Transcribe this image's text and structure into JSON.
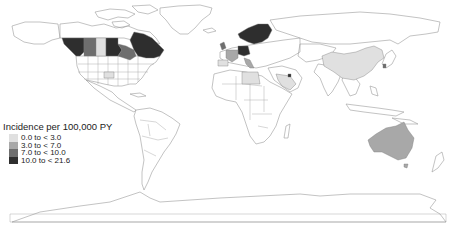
{
  "figure": {
    "type": "choropleth world map",
    "palette": {
      "c0": "#e0e0e0",
      "c1": "#a8a8a8",
      "c2": "#6e6e6e",
      "c3": "#2e2e2e",
      "no_data": "#ffffff",
      "border": "#9a9a9a"
    }
  },
  "legend": {
    "title": "Incidence per 100,000 PY",
    "items": [
      {
        "label": "0.0 to < 3.0",
        "color": "#e0e0e0"
      },
      {
        "label": "3.0 to < 7.0",
        "color": "#a8a8a8"
      },
      {
        "label": "7.0 to < 10.0",
        "color": "#6e6e6e"
      },
      {
        "label": "10.0 to < 21.6",
        "color": "#2e2e2e"
      }
    ]
  },
  "regions": [
    {
      "name": "British Columbia / Alberta (West Canada)",
      "class": "10.0 to < 21.6"
    },
    {
      "name": "Alberta",
      "class": "7.0 to < 10.0"
    },
    {
      "name": "Saskatchewan",
      "class": "0.0 to < 3.0"
    },
    {
      "name": "Manitoba",
      "class": "10.0 to < 21.6"
    },
    {
      "name": "Ontario",
      "class": "7.0 to < 10.0"
    },
    {
      "name": "Quebec / Atlantic Canada",
      "class": "10.0 to < 21.6"
    },
    {
      "name": "United States (one state)",
      "class": "0.0 to < 3.0"
    },
    {
      "name": "Scandinavia (Norway, Sweden, Finland)",
      "class": "10.0 to < 21.6"
    },
    {
      "name": "Germany",
      "class": "10.0 to < 21.6"
    },
    {
      "name": "France",
      "class": "3.0 to < 7.0"
    },
    {
      "name": "United Kingdom",
      "class": "7.0 to < 10.0"
    },
    {
      "name": "Italy",
      "class": "3.0 to < 7.0"
    },
    {
      "name": "Spain",
      "class": "0.0 to < 3.0"
    },
    {
      "name": "Libya",
      "class": "0.0 to < 3.0"
    },
    {
      "name": "Saudi Arabia",
      "class": "0.0 to < 3.0"
    },
    {
      "name": "Kuwait",
      "class": "10.0 to < 21.6"
    },
    {
      "name": "China",
      "class": "0.0 to < 3.0"
    },
    {
      "name": "South Korea",
      "class": "7.0 to < 10.0"
    },
    {
      "name": "Australia",
      "class": "3.0 to < 7.0"
    }
  ]
}
